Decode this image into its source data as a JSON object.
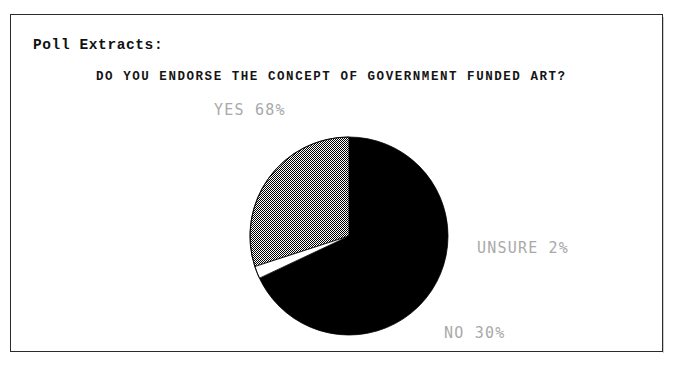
{
  "document": {
    "section_label": "Poll Extracts:",
    "question": "DO YOU ENDORSE THE CONCEPT OF GOVERNMENT FUNDED ART?"
  },
  "labels": {
    "yes": "YES 68%",
    "unsure": "UNSURE 2%",
    "no": "NO 30%"
  },
  "colors": {
    "yes_fill": "#000000",
    "no_fill": "#9a9a9a",
    "unsure_fill": "#ffffff",
    "label_text": "#a9a9a9",
    "heading_text": "#141414",
    "frame_border": "#2b2b2b",
    "page_background": "#ffffff"
  },
  "chart_data": {
    "type": "pie",
    "title": "DO YOU ENDORSE THE CONCEPT OF GOVERNMENT FUNDED ART?",
    "categories": [
      "YES",
      "UNSURE",
      "NO"
    ],
    "values": [
      68,
      2,
      30
    ],
    "value_unit": "%",
    "labels": [
      "YES 68%",
      "UNSURE 2%",
      "NO 30%"
    ],
    "slice_styles": [
      "solid-black",
      "white-outlined",
      "dithered-gray"
    ],
    "start_angle_deg": 0,
    "direction": "clockwise",
    "legend": "none",
    "grid": false,
    "label_positions": [
      "above-left",
      "right",
      "bottom-right"
    ]
  }
}
